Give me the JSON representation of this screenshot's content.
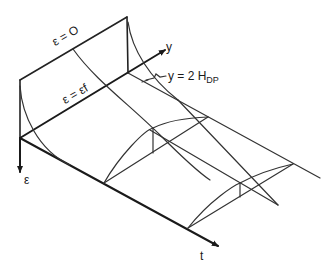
{
  "diagram": {
    "type": "3d isometric strain surface sketch",
    "axes": {
      "epsilon": {
        "label": "ε"
      },
      "y": {
        "label": "y"
      },
      "t": {
        "label": "t"
      }
    },
    "annotations": {
      "eps_zero": "ε = O",
      "eps_f": "ε = εf",
      "y_limit_main": "y = 2 H",
      "y_limit_sub": "DP"
    },
    "colors": {
      "line": "#222222",
      "background": "#ffffff"
    }
  }
}
